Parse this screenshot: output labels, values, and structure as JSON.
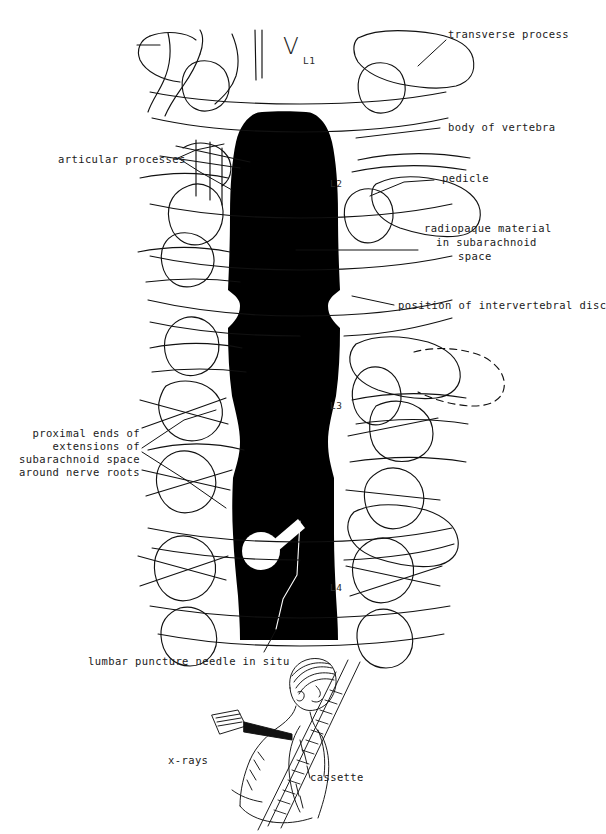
{
  "figure": {
    "background_color": "#ffffff",
    "ink_color": "#111111",
    "contrast_column_color": "#000000"
  },
  "vertebra_markers": [
    {
      "name": "L1",
      "glyph": "V",
      "label": "L1",
      "x": 283,
      "y": 33
    },
    {
      "name": "L2",
      "label": "L2",
      "x": 330,
      "y": 178
    },
    {
      "name": "L3",
      "label": "L3",
      "x": 330,
      "y": 400
    },
    {
      "name": "L4",
      "label": "L4",
      "x": 330,
      "y": 582
    }
  ],
  "labels": {
    "transverse_process": "transverse process",
    "body_of_vertebra": "body of vertebra",
    "articular_processes": "articular processes",
    "pedicle": "pedicle",
    "radiopaque_material_l1": "radiopaque material",
    "radiopaque_material_l2": "in subarachnoid",
    "radiopaque_material_l3": "space",
    "position_of_disc": "position of intervertebral disc",
    "proximal_ends_l1": "proximal ends of",
    "proximal_ends_l2": "extensions of",
    "proximal_ends_l3": "subarachnoid space",
    "proximal_ends_l4": "around nerve roots",
    "needle_in_situ": "lumbar puncture needle in situ",
    "xrays": "x-rays",
    "cassette": "cassette"
  },
  "inset": {
    "name": "patient-positioning-inset",
    "description": "seated patient leaning forward over cassette with x-ray beam from the left",
    "xray_label": "x-rays",
    "cassette_label": "cassette"
  }
}
